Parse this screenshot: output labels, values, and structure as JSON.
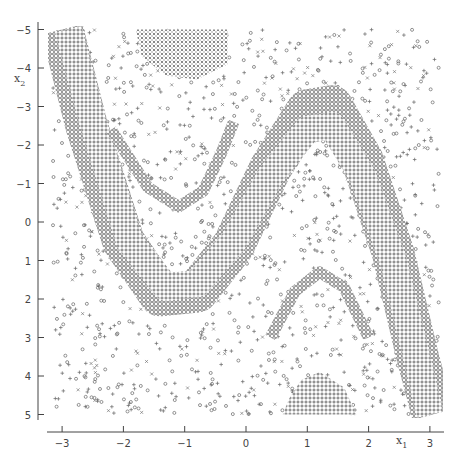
{
  "chart_data": {
    "type": "scatter",
    "title": "",
    "xlabel": "x1",
    "ylabel": "x2",
    "xlim": [
      -3.2,
      3.2
    ],
    "ylim": [
      -5,
      5
    ],
    "grid": false,
    "legend": null,
    "x_ticks": [
      -3,
      -2,
      -1,
      0,
      1,
      2,
      3
    ],
    "y_ticks": [
      -5,
      -4,
      -3,
      -2,
      -1,
      0,
      1,
      2,
      3,
      4,
      5
    ],
    "marker_types": [
      "o",
      "+",
      "x"
    ],
    "marker_color": "#555555",
    "regions": [
      {
        "name": "main-band",
        "marker": "o",
        "centerline": [
          [
            -3.0,
            5.0
          ],
          [
            -2.6,
            2.5
          ],
          [
            -2.0,
            -0.5
          ],
          [
            -1.4,
            -1.9
          ],
          [
            -0.8,
            -1.8
          ],
          [
            -0.2,
            -0.6
          ],
          [
            0.4,
            1.4
          ],
          [
            1.0,
            2.9
          ],
          [
            1.4,
            3.0
          ],
          [
            1.9,
            1.6
          ],
          [
            2.4,
            -0.8
          ],
          [
            2.8,
            -3.5
          ],
          [
            3.05,
            -5.0
          ]
        ],
        "half_width": 0.55
      },
      {
        "name": "inner-fill",
        "marker": "+",
        "centerline": [
          [
            -2.9,
            5.0
          ],
          [
            -2.5,
            2.6
          ],
          [
            -1.9,
            -0.5
          ],
          [
            -1.3,
            -1.7
          ],
          [
            -0.8,
            -1.6
          ],
          [
            -0.2,
            -0.5
          ],
          [
            0.4,
            1.2
          ],
          [
            1.0,
            2.4
          ],
          [
            1.4,
            2.5
          ],
          [
            1.9,
            1.2
          ],
          [
            2.4,
            -1.0
          ],
          [
            2.8,
            -3.6
          ],
          [
            3.0,
            -5.0
          ]
        ],
        "half_width": 0.35
      },
      {
        "name": "upper-x-patch",
        "marker": "x",
        "polygon": [
          [
            -1.8,
            5.0
          ],
          [
            -0.3,
            5.0
          ],
          [
            -0.3,
            4.1
          ],
          [
            -0.8,
            3.7
          ],
          [
            -1.3,
            3.8
          ],
          [
            -1.7,
            4.3
          ]
        ]
      },
      {
        "name": "lower-patch",
        "marker": "+",
        "polygon": [
          [
            0.6,
            -5.0
          ],
          [
            1.8,
            -5.0
          ],
          [
            1.6,
            -4.3
          ],
          [
            1.2,
            -3.9
          ],
          [
            0.9,
            -4.1
          ],
          [
            0.7,
            -4.6
          ]
        ]
      },
      {
        "name": "inner-arch-upper",
        "marker": "o",
        "centerline": [
          [
            -2.2,
            2.4
          ],
          [
            -1.6,
            0.9
          ],
          [
            -1.1,
            0.4
          ],
          [
            -0.7,
            0.8
          ],
          [
            -0.4,
            1.8
          ],
          [
            -0.2,
            2.6
          ]
        ],
        "half_width": 0.15
      },
      {
        "name": "inner-arch-lower",
        "marker": "o",
        "centerline": [
          [
            0.4,
            -3.0
          ],
          [
            0.8,
            -1.8
          ],
          [
            1.2,
            -1.3
          ],
          [
            1.6,
            -1.7
          ],
          [
            2.0,
            -3.0
          ]
        ],
        "half_width": 0.15
      }
    ]
  },
  "axes": {
    "xlabel": "x",
    "xlabel_sub": "1",
    "ylabel": "x",
    "ylabel_sub": "2",
    "x_tick_labels": [
      "−3",
      "−2",
      "−1",
      "0",
      "1",
      "2",
      "3"
    ],
    "y_tick_labels": [
      "5",
      "4",
      "3",
      "2",
      "1",
      "0",
      "−1",
      "−2",
      "−3",
      "−4",
      "−5"
    ]
  }
}
